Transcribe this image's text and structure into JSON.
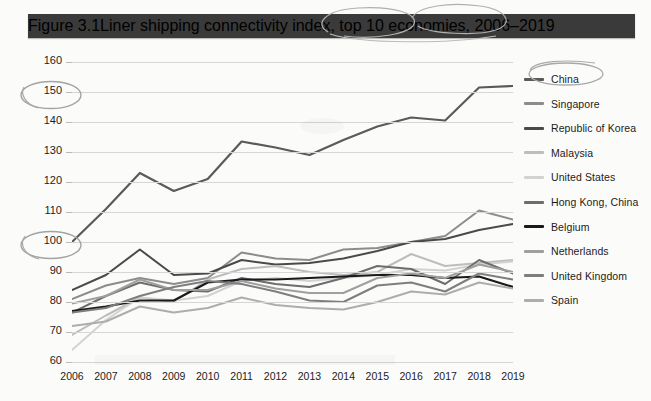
{
  "header": {
    "figure_number": "Figure 3.1",
    "title": "Liner shipping connectivity index, top 10 economies, 2006–2019"
  },
  "colors": {
    "title_bar_bg": "#3a3a3a",
    "title_text": "#ffffff",
    "page_bg": "#fbfbfa",
    "gridline": "#d6d6d6",
    "axis_text": "#1d1d1d",
    "annotation": "#9a9a9a"
  },
  "annotations": [
    {
      "name": "circle-around-150",
      "note": "hand-drawn ellipse around y-axis label 150"
    },
    {
      "name": "circle-around-100",
      "note": "hand-drawn ellipse around y-axis label 100"
    },
    {
      "name": "circle-around-china-legend",
      "note": "hand-drawn ellipse around China legend entry"
    },
    {
      "name": "circle-around-title-text",
      "note": "hand-drawn loop over title text near 'index, top 10'"
    }
  ],
  "chart_data": {
    "type": "line",
    "title": "Liner shipping connectivity index, top 10 economies, 2006–2019",
    "xlabel": "",
    "ylabel": "",
    "grid": true,
    "legend_position": "right",
    "ylim": [
      60,
      160
    ],
    "yticks": [
      60,
      70,
      80,
      90,
      100,
      110,
      120,
      130,
      140,
      150,
      160
    ],
    "categories": [
      2006,
      2007,
      2008,
      2009,
      2010,
      2011,
      2012,
      2013,
      2014,
      2015,
      2016,
      2017,
      2018,
      2019
    ],
    "x": [
      "2006",
      "2007",
      "2008",
      "2009",
      "2010",
      "2011",
      "2012",
      "2013",
      "2014",
      "2015",
      "2016",
      "2017",
      "2018",
      "2019"
    ],
    "series": [
      {
        "name": "China",
        "color": "#5a5a5a",
        "width": 2.2,
        "values": [
          100.0,
          111.0,
          123.0,
          117.0,
          121.0,
          133.5,
          131.5,
          129.0,
          134.0,
          138.5,
          141.5,
          140.5,
          151.5,
          152.0
        ]
      },
      {
        "name": "Singapore",
        "color": "#8c8c8c",
        "width": 2.0,
        "values": [
          81.0,
          85.5,
          88.0,
          86.0,
          88.0,
          96.5,
          94.5,
          94.0,
          97.5,
          98.0,
          100.0,
          102.0,
          110.5,
          107.5
        ]
      },
      {
        "name": "Republic of Korea",
        "color": "#4a4a4a",
        "width": 2.0,
        "values": [
          84.0,
          89.0,
          97.5,
          89.0,
          89.5,
          94.0,
          92.5,
          93.0,
          94.5,
          97.0,
          100.0,
          101.0,
          104.0,
          106.0
        ]
      },
      {
        "name": "Malaysia",
        "color": "#bdbdbd",
        "width": 2.0,
        "values": [
          69.0,
          75.5,
          81.5,
          80.0,
          87.5,
          91.0,
          92.0,
          90.0,
          89.0,
          90.0,
          96.0,
          92.0,
          93.0,
          94.0
        ]
      },
      {
        "name": "United States",
        "color": "#d2d2d2",
        "width": 2.0,
        "values": [
          64.0,
          74.0,
          81.5,
          80.5,
          82.0,
          87.0,
          88.0,
          87.0,
          88.0,
          89.0,
          91.0,
          90.5,
          92.5,
          93.5
        ]
      },
      {
        "name": "Hong Kong, China",
        "color": "#6d6d6d",
        "width": 2.0,
        "values": [
          76.5,
          82.0,
          86.5,
          84.0,
          83.5,
          88.0,
          86.0,
          85.0,
          88.0,
          92.0,
          91.0,
          86.0,
          94.0,
          89.5
        ]
      },
      {
        "name": "Belgium",
        "color": "#1a1a1a",
        "width": 2.2,
        "values": [
          77.0,
          78.5,
          80.5,
          80.5,
          86.5,
          87.5,
          87.5,
          88.0,
          88.5,
          89.0,
          89.0,
          88.0,
          88.5,
          85.0
        ]
      },
      {
        "name": "Netherlands",
        "color": "#9f9f9f",
        "width": 2.0,
        "values": [
          79.5,
          82.0,
          87.5,
          84.0,
          84.0,
          87.0,
          84.5,
          83.0,
          83.0,
          88.0,
          89.5,
          88.0,
          92.5,
          90.0
        ]
      },
      {
        "name": "United Kingdom",
        "color": "#7e7e7e",
        "width": 2.0,
        "values": [
          76.5,
          78.0,
          82.0,
          85.0,
          87.0,
          86.0,
          83.5,
          80.5,
          80.0,
          85.5,
          86.5,
          83.5,
          89.5,
          87.5
        ]
      },
      {
        "name": "Spain",
        "color": "#adadad",
        "width": 2.0,
        "values": [
          72.0,
          73.5,
          78.5,
          76.5,
          78.0,
          81.5,
          79.0,
          78.0,
          77.5,
          80.0,
          83.5,
          82.5,
          86.5,
          84.5
        ]
      }
    ]
  }
}
